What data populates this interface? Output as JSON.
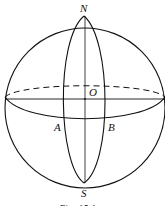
{
  "figure": {
    "caption": "Fig. 15.1",
    "labels": {
      "north": "N",
      "south": "S",
      "center": "O",
      "point_a": "A",
      "point_b": "B"
    }
  }
}
